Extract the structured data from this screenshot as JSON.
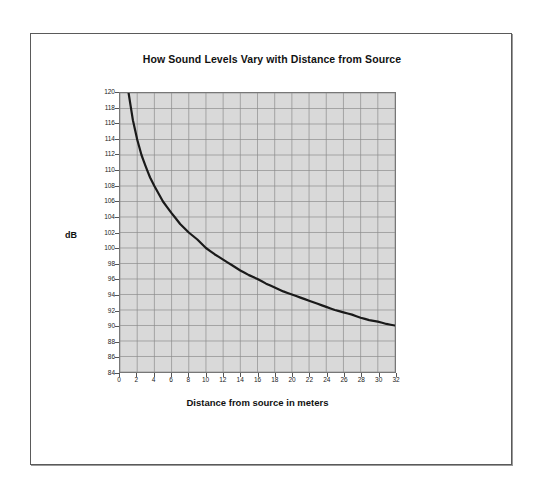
{
  "chart_data": {
    "type": "line",
    "title": "How Sound Levels Vary with Distance from Source",
    "xlabel": "Distance from source in meters",
    "ylabel": "dB",
    "xlim": [
      0,
      32
    ],
    "ylim": [
      84,
      120
    ],
    "xticks": [
      0,
      2,
      4,
      6,
      8,
      10,
      12,
      14,
      16,
      18,
      20,
      22,
      24,
      26,
      28,
      30,
      32
    ],
    "yticks": [
      84,
      86,
      88,
      90,
      92,
      94,
      96,
      98,
      100,
      102,
      104,
      106,
      108,
      110,
      112,
      114,
      116,
      118,
      120
    ],
    "grid": true,
    "legend": "none",
    "series": [
      {
        "name": "Sound level",
        "x": [
          1,
          1.5,
          2,
          2.5,
          3,
          3.5,
          4,
          5,
          6,
          7,
          8,
          9,
          10,
          11,
          12,
          13,
          14,
          15,
          16,
          17,
          18,
          19,
          20,
          21,
          22,
          23,
          24,
          25,
          26,
          27,
          28,
          29,
          30,
          31,
          32
        ],
        "values": [
          120,
          116.5,
          114,
          112,
          110.5,
          109.1,
          108,
          106,
          104.5,
          103.1,
          102,
          101.1,
          100,
          99.2,
          98.5,
          97.8,
          97.1,
          96.5,
          96,
          95.4,
          94.9,
          94.4,
          94,
          93.6,
          93.2,
          92.8,
          92.4,
          92,
          91.7,
          91.4,
          91,
          90.7,
          90.5,
          90.2,
          90
        ],
        "color": "#1a1a1a"
      }
    ],
    "plot_background": "#d9d9d9",
    "gridline_color": "#8c8c8c"
  }
}
